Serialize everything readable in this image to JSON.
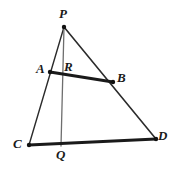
{
  "figure": {
    "background_color": "#ffffff",
    "stroke_color": "#1a1a1a",
    "thin_stroke_color": "#2b2b2b",
    "cevian_stroke_color": "#6e6e6e",
    "width": 176,
    "height": 172
  },
  "points": [
    {
      "id": "P",
      "label": "P",
      "x": 64,
      "y": 27,
      "label_x": 59,
      "label_y": 7,
      "marker": true
    },
    {
      "id": "A",
      "label": "A",
      "x": 50,
      "y": 72,
      "label_x": 36,
      "label_y": 62,
      "marker": true
    },
    {
      "id": "R",
      "label": "R",
      "x": 61,
      "y": 73,
      "label_x": 64,
      "label_y": 60,
      "marker": false
    },
    {
      "id": "B",
      "label": "B",
      "x": 113,
      "y": 82,
      "label_x": 117,
      "label_y": 71,
      "marker": true
    },
    {
      "id": "C",
      "label": "C",
      "x": 29,
      "y": 145,
      "label_x": 13,
      "label_y": 137,
      "marker": true
    },
    {
      "id": "Q",
      "label": "Q",
      "x": 61,
      "y": 146,
      "label_x": 56,
      "label_y": 148,
      "marker": false
    },
    {
      "id": "D",
      "label": "D",
      "x": 156,
      "y": 139,
      "label_x": 158,
      "label_y": 129,
      "marker": true
    }
  ],
  "segments": [
    {
      "id": "PC",
      "from": "P",
      "to": "C",
      "style": "thin",
      "width": 1.4,
      "color": "#2b2b2b"
    },
    {
      "id": "PD",
      "from": "P",
      "to": "D",
      "style": "thin",
      "width": 1.6,
      "color": "#2b2b2b"
    },
    {
      "id": "PQ",
      "from": "P",
      "to": "Q",
      "style": "cevian",
      "width": 1.3,
      "color": "#6e6e6e"
    },
    {
      "id": "AB",
      "from": "A",
      "to": "B",
      "style": "thick",
      "width": 3.0,
      "color": "#1a1a1a"
    },
    {
      "id": "CD",
      "from": "C",
      "to": "D",
      "style": "thick",
      "width": 3.0,
      "color": "#1a1a1a"
    }
  ],
  "markers": {
    "radius": 2.2,
    "color": "#111111"
  }
}
